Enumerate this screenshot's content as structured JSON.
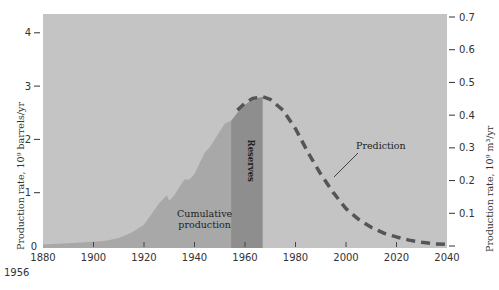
{
  "chart_data": {
    "type": "area",
    "title": "",
    "xlabel": "",
    "ylabel": "Production rate, 10^9 barrels/yr",
    "ylabel_right": "Production rate, 10^9 m^3/yr",
    "xlim": [
      1880,
      2040
    ],
    "ylim": [
      0,
      4.4
    ],
    "ylim_right": [
      0,
      0.7
    ],
    "x_ticks": [
      1880,
      1900,
      1920,
      1940,
      1960,
      1980,
      2000,
      2020,
      2040
    ],
    "y_ticks_left": [
      0,
      1,
      2,
      3,
      4
    ],
    "y_ticks_right": [
      0.1,
      0.2,
      0.3,
      0.4,
      0.5,
      0.6,
      0.7
    ],
    "x_footnote": "1956",
    "grid": false,
    "series": [
      {
        "name": "Cumulative production",
        "kind": "area",
        "x": [
          1880,
          1890,
          1900,
          1905,
          1910,
          1915,
          1920,
          1923,
          1926,
          1929,
          1930,
          1932,
          1934,
          1936,
          1938,
          1940,
          1942,
          1944,
          1946,
          1948,
          1950,
          1952,
          1954.5
        ],
        "values": [
          0.03,
          0.05,
          0.08,
          0.1,
          0.15,
          0.25,
          0.4,
          0.6,
          0.8,
          0.95,
          0.85,
          0.95,
          1.1,
          1.25,
          1.25,
          1.35,
          1.55,
          1.75,
          1.85,
          2.0,
          2.15,
          2.3,
          2.35
        ]
      },
      {
        "name": "Reserves",
        "kind": "area",
        "x": [
          1954.5,
          1957,
          1960,
          1963,
          1967
        ],
        "values": [
          2.35,
          2.5,
          2.65,
          2.75,
          2.8
        ]
      },
      {
        "name": "Prediction",
        "kind": "dashed-line",
        "x": [
          1957,
          1960,
          1963,
          1967,
          1970,
          1975,
          1980,
          1985,
          1990,
          1995,
          2000,
          2005,
          2010,
          2015,
          2020,
          2025,
          2030,
          2035,
          2040
        ],
        "values": [
          2.55,
          2.68,
          2.77,
          2.8,
          2.75,
          2.55,
          2.2,
          1.75,
          1.35,
          1.0,
          0.7,
          0.5,
          0.35,
          0.24,
          0.17,
          0.11,
          0.07,
          0.04,
          0.03
        ]
      }
    ],
    "annotations": [
      {
        "text": "Cumulative production",
        "lines": [
          "Cumulative",
          "production"
        ],
        "x": 1944,
        "y": 0.45
      },
      {
        "text": "Reserves",
        "x": 1961,
        "y": 1.6,
        "rotation": 90
      },
      {
        "text": "Prediction",
        "x": 2000,
        "y": 1.9,
        "leader_to": [
          1987,
          1.6
        ]
      }
    ],
    "colors": {
      "background": "#c4c4c4",
      "cumulative": "#a8a8a8",
      "reserves": "#8e8e8e",
      "prediction": "#555555"
    }
  }
}
